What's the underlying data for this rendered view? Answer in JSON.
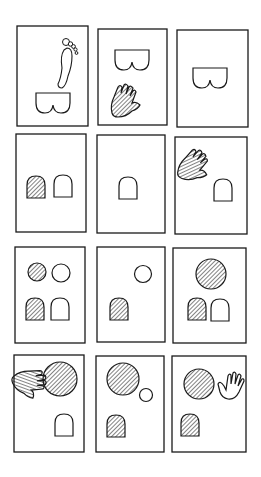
{
  "diagram": {
    "layout": {
      "rows": 4,
      "cols": 3
    },
    "colors": {
      "ink": "#1a1a1a",
      "paper": "#ffffff"
    },
    "panels": [
      {
        "id": 1,
        "row": 1,
        "col": 1,
        "contents": [
          "foot",
          "bottom-outline"
        ]
      },
      {
        "id": 2,
        "row": 1,
        "col": 2,
        "contents": [
          "bottom-outline",
          "hatched-hand"
        ]
      },
      {
        "id": 3,
        "row": 1,
        "col": 3,
        "contents": [
          "bottom-outline"
        ]
      },
      {
        "id": 4,
        "row": 2,
        "col": 1,
        "contents": [
          "hatched-arch",
          "open-arch"
        ]
      },
      {
        "id": 5,
        "row": 2,
        "col": 2,
        "contents": [
          "open-arch"
        ]
      },
      {
        "id": 6,
        "row": 2,
        "col": 3,
        "contents": [
          "hatched-hand",
          "open-arch"
        ]
      },
      {
        "id": 7,
        "row": 3,
        "col": 1,
        "contents": [
          "hatched-circle-small",
          "open-circle-small",
          "hatched-arch",
          "open-arch"
        ]
      },
      {
        "id": 8,
        "row": 3,
        "col": 2,
        "contents": [
          "open-circle-small",
          "hatched-arch"
        ]
      },
      {
        "id": 9,
        "row": 3,
        "col": 3,
        "contents": [
          "hatched-circle-large",
          "hatched-arch",
          "open-arch"
        ]
      },
      {
        "id": 10,
        "row": 4,
        "col": 1,
        "contents": [
          "hatched-hand",
          "hatched-circle-large",
          "open-arch"
        ]
      },
      {
        "id": 11,
        "row": 4,
        "col": 2,
        "contents": [
          "hatched-circle-large",
          "open-circle-small",
          "hatched-arch"
        ]
      },
      {
        "id": 12,
        "row": 4,
        "col": 3,
        "contents": [
          "hatched-circle-large",
          "open-hand",
          "hatched-arch"
        ]
      }
    ]
  }
}
